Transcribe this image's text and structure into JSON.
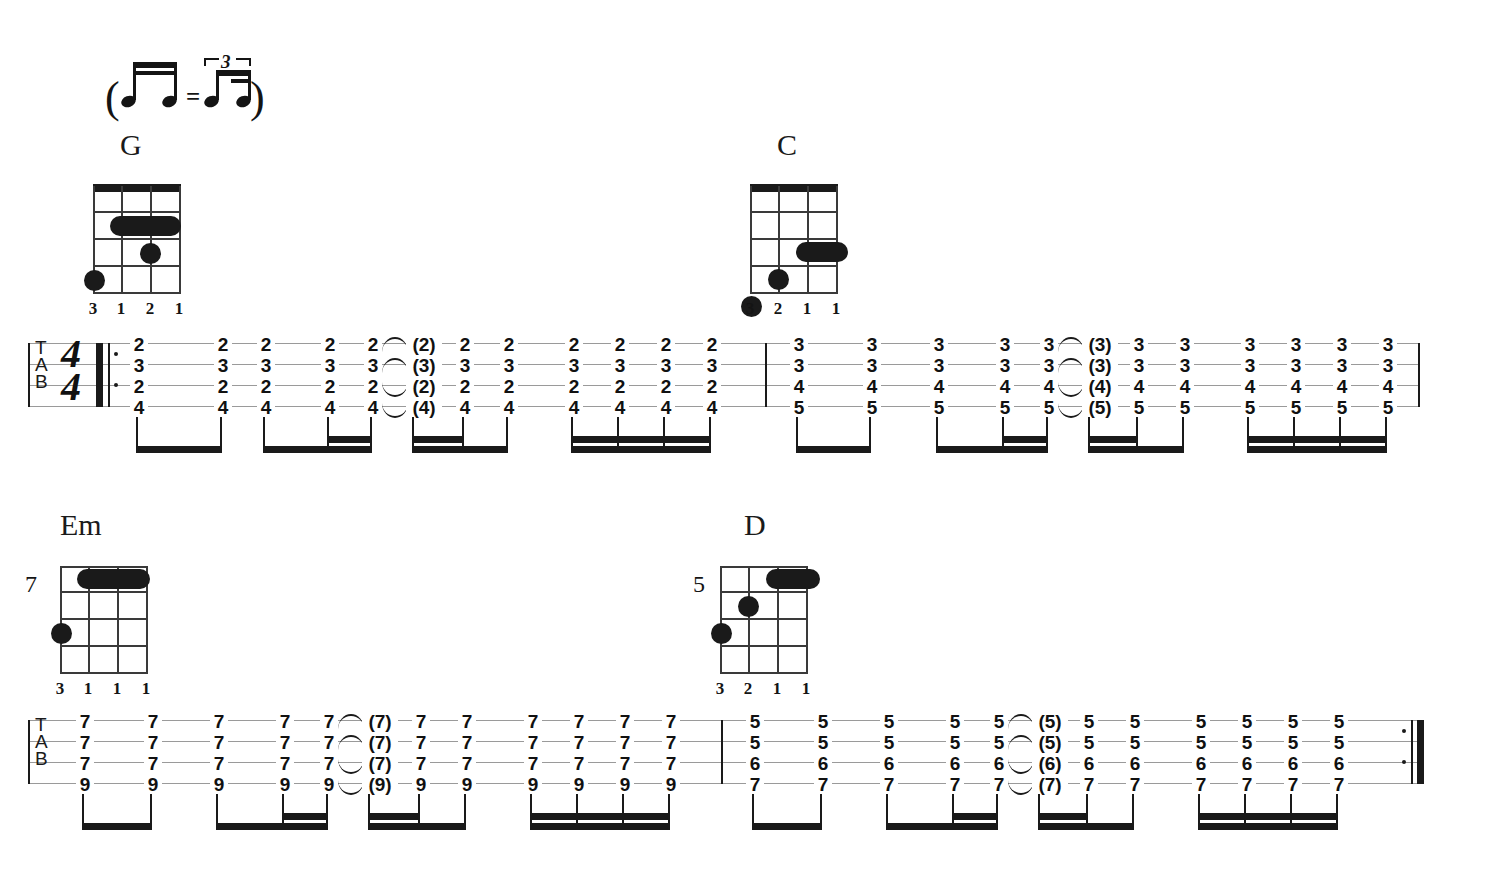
{
  "document": {
    "type": "guitar-tablature",
    "title": "Swing Strum Tab",
    "background_color": "#ffffff",
    "ink_color": "#141414"
  },
  "tempo_legend": {
    "label": "swing-eighths-equivalence",
    "open_paren": "(",
    "close_paren": ")",
    "equals": "=",
    "triplet_number": "3"
  },
  "chord_diagrams": [
    {
      "name": "G",
      "strings": 4,
      "frets": 5,
      "has_nut": true,
      "position_marker": "",
      "fingers": [
        "3",
        "1",
        "2",
        "1"
      ],
      "barre": {
        "fret": 2,
        "from_string": 2,
        "to_string": 4
      },
      "dots": [
        {
          "string": 3,
          "fret": 3
        },
        {
          "string": 1,
          "fret": 4
        }
      ]
    },
    {
      "name": "C",
      "strings": 4,
      "frets": 5,
      "has_nut": true,
      "position_marker": "",
      "fingers": [
        "3",
        "2",
        "1",
        "1"
      ],
      "barre": {
        "fret": 3,
        "from_string": 3,
        "to_string": 4
      },
      "dots": [
        {
          "string": 2,
          "fret": 4
        },
        {
          "string": 1,
          "fret": 5
        }
      ]
    },
    {
      "name": "Em",
      "strings": 4,
      "frets": 5,
      "has_nut": false,
      "position_marker": "7",
      "fingers": [
        "3",
        "1",
        "1",
        "1"
      ],
      "barre": {
        "fret": 1,
        "from_string": 2,
        "to_string": 4
      },
      "dots": [
        {
          "string": 1,
          "fret": 3
        }
      ]
    },
    {
      "name": "D",
      "strings": 4,
      "frets": 5,
      "has_nut": false,
      "position_marker": "5",
      "fingers": [
        "3",
        "2",
        "1",
        "1"
      ],
      "barre": {
        "fret": 1,
        "from_string": 3,
        "to_string": 4
      },
      "dots": [
        {
          "string": 2,
          "fret": 2
        },
        {
          "string": 1,
          "fret": 3
        }
      ]
    }
  ],
  "staves": [
    {
      "index": 1,
      "clef": "TAB",
      "clef_letters": [
        "T",
        "A",
        "B"
      ],
      "time_signature": {
        "beats": "4",
        "unit": "4"
      },
      "start_repeat": true,
      "end_barline": "plain",
      "measures": [
        {
          "chord": "G",
          "chord_tones": [
            "2",
            "3",
            "2",
            "4"
          ],
          "notes": [
            {
              "frets": [
                "2",
                "3",
                "2",
                "4"
              ],
              "tied": false,
              "parenthesized": false
            },
            {
              "frets": [
                "2",
                "3",
                "2",
                "4"
              ],
              "tied": false,
              "parenthesized": false
            },
            {
              "frets": [
                "2",
                "3",
                "2",
                "4"
              ],
              "tied": false,
              "parenthesized": false
            },
            {
              "frets": [
                "2",
                "3",
                "2",
                "4"
              ],
              "tied": false,
              "parenthesized": false
            },
            {
              "frets": [
                "2",
                "3",
                "2",
                "4"
              ],
              "tied": true,
              "parenthesized": false
            },
            {
              "frets": [
                "(2)",
                "(3)",
                "(2)",
                "(4)"
              ],
              "tied": false,
              "parenthesized": true
            },
            {
              "frets": [
                "2",
                "3",
                "2",
                "4"
              ],
              "tied": false,
              "parenthesized": false
            },
            {
              "frets": [
                "2",
                "3",
                "2",
                "4"
              ],
              "tied": false,
              "parenthesized": false
            },
            {
              "frets": [
                "2",
                "3",
                "2",
                "4"
              ],
              "tied": false,
              "parenthesized": false
            },
            {
              "frets": [
                "2",
                "3",
                "2",
                "4"
              ],
              "tied": false,
              "parenthesized": false
            },
            {
              "frets": [
                "2",
                "3",
                "2",
                "4"
              ],
              "tied": false,
              "parenthesized": false
            },
            {
              "frets": [
                "2",
                "3",
                "2",
                "4"
              ],
              "tied": false,
              "parenthesized": false
            }
          ]
        },
        {
          "chord": "C",
          "chord_tones": [
            "3",
            "3",
            "4",
            "5"
          ],
          "notes": [
            {
              "frets": [
                "3",
                "3",
                "4",
                "5"
              ],
              "tied": false,
              "parenthesized": false
            },
            {
              "frets": [
                "3",
                "3",
                "4",
                "5"
              ],
              "tied": false,
              "parenthesized": false
            },
            {
              "frets": [
                "3",
                "3",
                "4",
                "5"
              ],
              "tied": false,
              "parenthesized": false
            },
            {
              "frets": [
                "3",
                "3",
                "4",
                "5"
              ],
              "tied": false,
              "parenthesized": false
            },
            {
              "frets": [
                "3",
                "3",
                "4",
                "5"
              ],
              "tied": true,
              "parenthesized": false
            },
            {
              "frets": [
                "(3)",
                "(3)",
                "(4)",
                "(5)"
              ],
              "tied": false,
              "parenthesized": true
            },
            {
              "frets": [
                "3",
                "3",
                "4",
                "5"
              ],
              "tied": false,
              "parenthesized": false
            },
            {
              "frets": [
                "3",
                "3",
                "4",
                "5"
              ],
              "tied": false,
              "parenthesized": false
            },
            {
              "frets": [
                "3",
                "3",
                "4",
                "5"
              ],
              "tied": false,
              "parenthesized": false
            },
            {
              "frets": [
                "3",
                "3",
                "4",
                "5"
              ],
              "tied": false,
              "parenthesized": false
            },
            {
              "frets": [
                "3",
                "3",
                "4",
                "5"
              ],
              "tied": false,
              "parenthesized": false
            },
            {
              "frets": [
                "3",
                "3",
                "4",
                "5"
              ],
              "tied": false,
              "parenthesized": false
            }
          ]
        }
      ]
    },
    {
      "index": 2,
      "clef": "TAB",
      "clef_letters": [
        "T",
        "A",
        "B"
      ],
      "time_signature": null,
      "start_repeat": false,
      "end_barline": "end-repeat",
      "measures": [
        {
          "chord": "Em",
          "chord_tones": [
            "7",
            "7",
            "7",
            "9"
          ],
          "notes": [
            {
              "frets": [
                "7",
                "7",
                "7",
                "9"
              ],
              "tied": false,
              "parenthesized": false
            },
            {
              "frets": [
                "7",
                "7",
                "7",
                "9"
              ],
              "tied": false,
              "parenthesized": false
            },
            {
              "frets": [
                "7",
                "7",
                "7",
                "9"
              ],
              "tied": false,
              "parenthesized": false
            },
            {
              "frets": [
                "7",
                "7",
                "7",
                "9"
              ],
              "tied": false,
              "parenthesized": false
            },
            {
              "frets": [
                "7",
                "7",
                "7",
                "9"
              ],
              "tied": true,
              "parenthesized": false
            },
            {
              "frets": [
                "(7)",
                "(7)",
                "(7)",
                "(9)"
              ],
              "tied": false,
              "parenthesized": true
            },
            {
              "frets": [
                "7",
                "7",
                "7",
                "9"
              ],
              "tied": false,
              "parenthesized": false
            },
            {
              "frets": [
                "7",
                "7",
                "7",
                "9"
              ],
              "tied": false,
              "parenthesized": false
            },
            {
              "frets": [
                "7",
                "7",
                "7",
                "9"
              ],
              "tied": false,
              "parenthesized": false
            },
            {
              "frets": [
                "7",
                "7",
                "7",
                "9"
              ],
              "tied": false,
              "parenthesized": false
            },
            {
              "frets": [
                "7",
                "7",
                "7",
                "9"
              ],
              "tied": false,
              "parenthesized": false
            },
            {
              "frets": [
                "7",
                "7",
                "7",
                "9"
              ],
              "tied": false,
              "parenthesized": false
            }
          ]
        },
        {
          "chord": "D",
          "chord_tones": [
            "5",
            "5",
            "6",
            "7"
          ],
          "notes": [
            {
              "frets": [
                "5",
                "5",
                "6",
                "7"
              ],
              "tied": false,
              "parenthesized": false
            },
            {
              "frets": [
                "5",
                "5",
                "6",
                "7"
              ],
              "tied": false,
              "parenthesized": false
            },
            {
              "frets": [
                "5",
                "5",
                "6",
                "7"
              ],
              "tied": false,
              "parenthesized": false
            },
            {
              "frets": [
                "5",
                "5",
                "6",
                "7"
              ],
              "tied": false,
              "parenthesized": false
            },
            {
              "frets": [
                "5",
                "5",
                "6",
                "7"
              ],
              "tied": true,
              "parenthesized": false
            },
            {
              "frets": [
                "(5)",
                "(5)",
                "(6)",
                "(7)"
              ],
              "tied": false,
              "parenthesized": true
            },
            {
              "frets": [
                "5",
                "5",
                "6",
                "7"
              ],
              "tied": false,
              "parenthesized": false
            },
            {
              "frets": [
                "5",
                "5",
                "6",
                "7"
              ],
              "tied": false,
              "parenthesized": false
            },
            {
              "frets": [
                "5",
                "5",
                "6",
                "7"
              ],
              "tied": false,
              "parenthesized": false
            },
            {
              "frets": [
                "5",
                "5",
                "6",
                "7"
              ],
              "tied": false,
              "parenthesized": false
            },
            {
              "frets": [
                "5",
                "5",
                "6",
                "7"
              ],
              "tied": false,
              "parenthesized": false
            },
            {
              "frets": [
                "5",
                "5",
                "6",
                "7"
              ],
              "tied": false,
              "parenthesized": false
            }
          ]
        }
      ]
    }
  ]
}
